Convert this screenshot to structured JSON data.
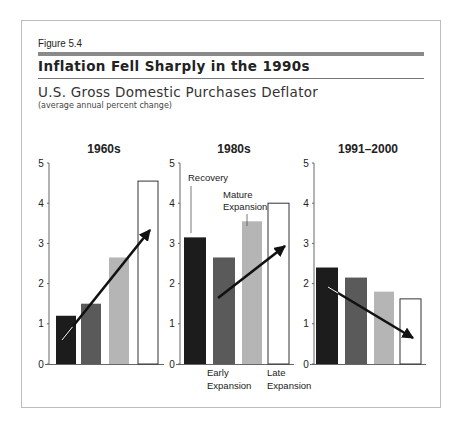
{
  "figure": {
    "label": "Figure 5.4",
    "title": "Inflation Fell Sharply in the 1990s",
    "subtitle": "U.S. Gross Domestic Purchases Deflator",
    "note": "(average annual percent change)"
  },
  "colors": {
    "recovery": "#1c1c1c",
    "early_expansion": "#5a5a5a",
    "mature_expansion": "#b5b5b5",
    "late_expansion": "#ffffff",
    "frame": "#bdbdbd",
    "rule": "#8a8a8a"
  },
  "chart_data": [
    {
      "type": "bar",
      "title": "1960s",
      "categories": [
        "Recovery",
        "Early Expansion",
        "Mature Expansion",
        "Late Expansion"
      ],
      "values": [
        1.2,
        1.5,
        2.65,
        4.55
      ],
      "ylim": [
        0,
        5
      ],
      "yticks": [
        0,
        1,
        2,
        3,
        4,
        5
      ],
      "trend_arrow": "up"
    },
    {
      "type": "bar",
      "title": "1980s",
      "categories": [
        "Recovery",
        "Early Expansion",
        "Mature Expansion",
        "Late Expansion"
      ],
      "values": [
        3.15,
        2.65,
        3.55,
        4.0
      ],
      "ylim": [
        0,
        5
      ],
      "yticks": [
        0,
        1,
        2,
        3,
        4,
        5
      ],
      "trend_arrow": "up",
      "annotations": [
        "Recovery",
        "Mature Expansion",
        "Early Expansion",
        "Late Expansion"
      ]
    },
    {
      "type": "bar",
      "title": "1991–2000",
      "categories": [
        "Recovery",
        "Early Expansion",
        "Mature Expansion",
        "Late Expansion"
      ],
      "values": [
        2.4,
        2.15,
        1.8,
        1.62
      ],
      "ylim": [
        0,
        5
      ],
      "yticks": [
        0,
        1,
        2,
        3,
        4,
        5
      ],
      "trend_arrow": "down"
    }
  ]
}
